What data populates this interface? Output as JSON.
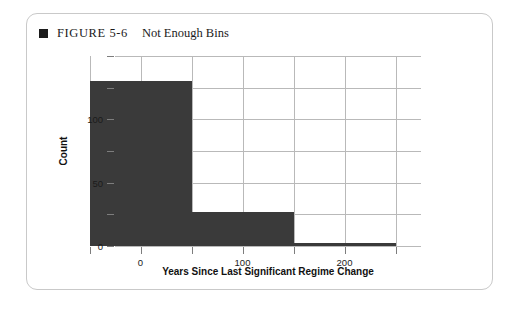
{
  "caption": {
    "bullet_icon": "black-square-bullet",
    "figure_number": "FIGURE 5-6",
    "title": "Not Enough Bins"
  },
  "colors": {
    "bar": "#3a3a3a",
    "gridline": "#b9b9b9",
    "tick": "#7d7d7d",
    "text": "#1b1b1b",
    "card_border": "#c9c9c9",
    "background": "#ffffff"
  },
  "chart_data": {
    "type": "bar",
    "title": "Not Enough Bins",
    "xlabel": "Years Since Last Significant Regime Change",
    "ylabel": "Count",
    "xlim": [
      -25,
      275
    ],
    "ylim": [
      0,
      150
    ],
    "grid": true,
    "legend": "none",
    "bin_width": 100,
    "bin_edges": [
      -50,
      50,
      150,
      250
    ],
    "categories": [
      "-50 to 50",
      "50 to 150",
      "150 to 250"
    ],
    "values": [
      130,
      27,
      2
    ],
    "x_ticks_major": [
      0,
      100,
      200
    ],
    "x_tick_labels_major": [
      "0",
      "100",
      "200"
    ],
    "x_ticks_minor": [
      -50,
      50,
      150,
      250
    ],
    "y_ticks_major": [
      0,
      50,
      100
    ],
    "y_tick_labels_major": [
      "0",
      "50",
      "100"
    ],
    "y_ticks_minor": [
      25,
      75,
      125,
      150
    ]
  }
}
